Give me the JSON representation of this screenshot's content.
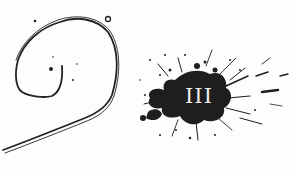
{
  "illustration": {
    "left_figure": "hand-drawn-spiral-hook",
    "right_figure": "ink-splatter",
    "numeral": "III",
    "colors": {
      "ink": "#1e1e1e",
      "background": "#fdfdfd",
      "numeral": "#f0f0f0"
    }
  }
}
